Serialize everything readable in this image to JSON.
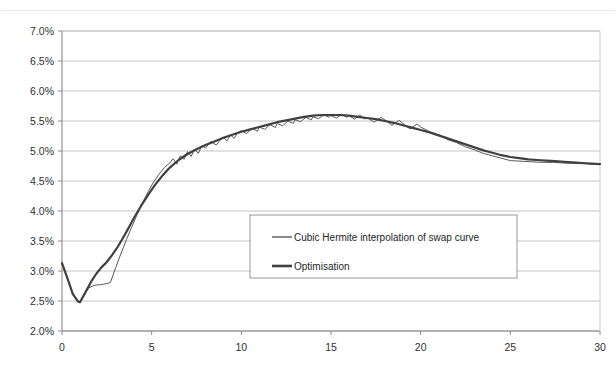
{
  "figure": {
    "title_faint": "",
    "background": "#ffffff",
    "plot_area": {
      "left": 62,
      "top": 31,
      "right": 600,
      "bottom": 331
    }
  },
  "chart_data": {
    "type": "line",
    "title": "",
    "xlabel": "",
    "ylabel": "",
    "xlim": [
      0,
      30
    ],
    "ylim": [
      0.02,
      0.07
    ],
    "grid": true,
    "grid_axis": "y",
    "xticks": [
      0,
      5,
      10,
      15,
      20,
      25,
      30
    ],
    "xticklabels": [
      "0",
      "5",
      "10",
      "15",
      "20",
      "25",
      "30"
    ],
    "yticks": [
      0.02,
      0.025,
      0.03,
      0.035,
      0.04,
      0.045,
      0.05,
      0.055,
      0.06,
      0.065,
      0.07
    ],
    "yticklabels": [
      "2.0%",
      "2.5%",
      "3.0%",
      "3.5%",
      "4.0%",
      "4.5%",
      "5.0%",
      "5.5%",
      "6.0%",
      "6.5%",
      "7.0%"
    ],
    "legend": {
      "position": "center",
      "box": {
        "x": 250,
        "y": 215,
        "width": 267,
        "height": 63
      },
      "entries": [
        {
          "name": "Cubic Hermite interpolation of swap curve",
          "color": "#595959",
          "linewidth": 1
        },
        {
          "name": "Optimisation",
          "color": "#404040",
          "linewidth": 2.2
        }
      ]
    },
    "series": [
      {
        "name": "Cubic Hermite interpolation of swap curve",
        "color": "#595959",
        "linewidth": 1,
        "x": [
          0.0,
          0.3,
          0.6,
          0.9,
          1.0,
          1.2,
          1.5,
          1.8,
          2.0,
          2.15,
          2.3,
          2.5,
          2.7,
          3.0,
          3.3,
          3.6,
          3.9,
          4.2,
          4.5,
          4.8,
          5.1,
          5.4,
          5.7,
          6.0,
          6.2,
          6.4,
          6.6,
          6.8,
          7.0,
          7.2,
          7.4,
          7.6,
          7.8,
          8.0,
          8.3,
          8.6,
          8.9,
          9.0,
          9.2,
          9.4,
          9.6,
          9.8,
          10.0,
          10.3,
          10.6,
          10.9,
          11.0,
          11.3,
          11.6,
          11.9,
          12.0,
          12.3,
          12.6,
          12.9,
          13.0,
          13.3,
          13.6,
          13.9,
          14.0,
          14.3,
          14.6,
          14.9,
          15.0,
          15.3,
          15.6,
          15.9,
          16.0,
          16.3,
          16.6,
          16.9,
          17.0,
          17.4,
          17.8,
          18.0,
          18.4,
          18.8,
          19.0,
          19.4,
          19.8,
          20.0,
          20.5,
          21.0,
          21.5,
          22.0,
          22.5,
          23.0,
          23.5,
          24.0,
          24.5,
          25.0,
          25.6,
          26.2,
          26.8,
          27.4,
          28.0,
          28.6,
          29.2,
          29.6,
          30.0
        ],
        "y": [
          0.0313,
          0.0288,
          0.0262,
          0.0249,
          0.0248,
          0.0259,
          0.0272,
          0.0276,
          0.0277,
          0.0277,
          0.0278,
          0.0279,
          0.0281,
          0.0306,
          0.033,
          0.0353,
          0.0374,
          0.0395,
          0.0414,
          0.0432,
          0.0448,
          0.0461,
          0.0472,
          0.048,
          0.0487,
          0.0478,
          0.0492,
          0.0486,
          0.0499,
          0.0491,
          0.0503,
          0.0496,
          0.0509,
          0.0505,
          0.0516,
          0.051,
          0.0521,
          0.0523,
          0.0517,
          0.0527,
          0.0521,
          0.0531,
          0.0534,
          0.0529,
          0.0538,
          0.0533,
          0.054,
          0.0536,
          0.0544,
          0.0539,
          0.0546,
          0.0542,
          0.055,
          0.0546,
          0.0552,
          0.0549,
          0.0556,
          0.0552,
          0.0557,
          0.0554,
          0.056,
          0.0556,
          0.0559,
          0.0555,
          0.0561,
          0.0556,
          0.0559,
          0.0553,
          0.056,
          0.0553,
          0.0556,
          0.0548,
          0.0556,
          0.0552,
          0.0543,
          0.0551,
          0.0546,
          0.0537,
          0.0545,
          0.054,
          0.0532,
          0.0527,
          0.0519,
          0.0514,
          0.0507,
          0.0502,
          0.0496,
          0.0492,
          0.0488,
          0.0484,
          0.0483,
          0.0482,
          0.0481,
          0.0481,
          0.048,
          0.0479,
          0.0479,
          0.0478,
          0.0478
        ]
      },
      {
        "name": "Optimisation",
        "color": "#404040",
        "linewidth": 2.2,
        "x": [
          0.0,
          0.3,
          0.6,
          0.9,
          1.0,
          1.3,
          1.6,
          1.9,
          2.2,
          2.5,
          2.8,
          3.1,
          3.4,
          3.7,
          4.0,
          4.4,
          4.8,
          5.2,
          5.6,
          6.0,
          6.5,
          7.0,
          7.5,
          8.0,
          8.5,
          9.0,
          9.5,
          10.0,
          10.5,
          11.0,
          11.5,
          12.0,
          12.5,
          13.0,
          13.5,
          14.0,
          14.5,
          15.0,
          15.5,
          16.0,
          16.5,
          17.0,
          17.5,
          18.0,
          18.5,
          19.0,
          19.5,
          20.0,
          20.5,
          21.0,
          21.5,
          22.0,
          22.5,
          23.0,
          23.5,
          24.0,
          24.5,
          25.0,
          25.5,
          26.0,
          26.5,
          27.0,
          27.5,
          28.0,
          28.5,
          29.0,
          29.5,
          30.0
        ],
        "y": [
          0.0313,
          0.0288,
          0.0262,
          0.0249,
          0.0248,
          0.0264,
          0.0281,
          0.0295,
          0.0306,
          0.0315,
          0.0327,
          0.034,
          0.0355,
          0.0371,
          0.0388,
          0.0408,
          0.0427,
          0.0444,
          0.0459,
          0.0472,
          0.0485,
          0.0495,
          0.0503,
          0.051,
          0.0516,
          0.0522,
          0.0527,
          0.0532,
          0.0536,
          0.054,
          0.0544,
          0.0548,
          0.0551,
          0.0554,
          0.0557,
          0.0559,
          0.056,
          0.056,
          0.056,
          0.0559,
          0.0557,
          0.0555,
          0.0553,
          0.055,
          0.0547,
          0.0543,
          0.0539,
          0.0535,
          0.0531,
          0.0526,
          0.0521,
          0.0516,
          0.0511,
          0.0506,
          0.0501,
          0.0497,
          0.0493,
          0.049,
          0.0488,
          0.0486,
          0.0485,
          0.0484,
          0.0483,
          0.0482,
          0.0481,
          0.048,
          0.0479,
          0.0478
        ]
      }
    ]
  }
}
